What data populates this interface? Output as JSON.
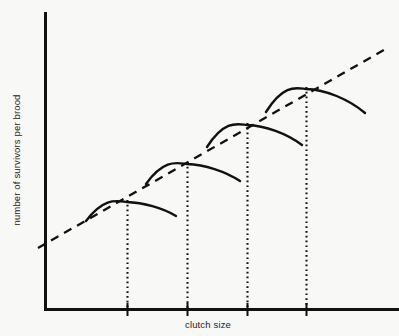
{
  "chart_data": {
    "type": "line",
    "title": "",
    "subtitle": "",
    "xlabel": "clutch size",
    "ylabel": "number of survivors per brood",
    "grid": false,
    "legend": null,
    "axes": {
      "x_axis_arrow": false,
      "y_axis_arrow": false,
      "tick_labels_x": [],
      "tick_labels_y": [],
      "x_range_note": "unlabeled ordinal axis, 4 tick marks",
      "y_range_note": "unlabeled axis"
    },
    "annotations": [
      {
        "name": "trend-line",
        "style": "dashed",
        "description": "rising dashed straight line through the peaks of all four curves",
        "x_start_px": 38,
        "y_start_px": 248,
        "x_end_px": 389,
        "y_end_px": 47
      }
    ],
    "x_ticks_px": [
      127,
      187,
      247,
      306
    ],
    "series": [
      {
        "name": "brood curve 1",
        "style": "solid-arc",
        "peak_x_px": 127,
        "peak_y_px": 202,
        "start_x_px": 86,
        "start_y_px": 221,
        "end_x_px": 176,
        "end_y_px": 216,
        "peak_value_rel": 1
      },
      {
        "name": "brood curve 2",
        "style": "solid-arc",
        "peak_x_px": 187,
        "peak_y_px": 164,
        "start_x_px": 146,
        "start_y_px": 184,
        "end_x_px": 240,
        "end_y_px": 181,
        "peak_value_rel": 2
      },
      {
        "name": "brood curve 3",
        "style": "solid-arc",
        "peak_x_px": 247,
        "peak_y_px": 125,
        "start_x_px": 207,
        "start_y_px": 147,
        "end_x_px": 302,
        "end_y_px": 145,
        "peak_value_rel": 3
      },
      {
        "name": "brood curve 4",
        "style": "solid-arc",
        "peak_x_px": 306,
        "peak_y_px": 89,
        "start_x_px": 266,
        "start_y_px": 112,
        "end_x_px": 365,
        "end_y_px": 113,
        "peak_value_rel": 4
      }
    ],
    "dropline_count": 4,
    "dropline_style": "dotted",
    "colors": {
      "background": "#f8f8f6",
      "axis": "#111111",
      "curve": "#111111",
      "trend": "#111111",
      "dropline": "#111111",
      "text": "#1b1b1b"
    }
  }
}
